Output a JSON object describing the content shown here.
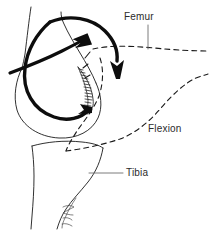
{
  "figure": {
    "background_color": "#ffffff",
    "ink_color": "#1a1a1a",
    "label_color": "#2b2b2b",
    "width": 209,
    "height": 241
  },
  "labels": {
    "femur": "Femur",
    "flexion": "Flexion",
    "tibia": "Tibia"
  },
  "leaders": {
    "femur": {
      "type": "vertical-leader-line",
      "from": [
        148,
        24
      ],
      "to": [
        148,
        49
      ]
    },
    "tibia": {
      "type": "horizontal-leader-line",
      "from": [
        89,
        173
      ],
      "to": [
        123,
        173
      ]
    }
  },
  "icons": {
    "roll_arrow": "curved-arrow-icon",
    "glide_arrow": "straight-arrow-icon",
    "loop_arrow": "loop-arrow-icon",
    "signature": "artist-signature-mark"
  },
  "strokes": {
    "femur_shaft": "M 30 8 L 25 62",
    "condyle_outline": "M 25 62 C 16 76 13 96 18 112 C 24 129 42 140 62 140 C 80 140 94 130 99 116 C 103 104 101 92 96 82",
    "condyle_inner": "M 96 82 C 92 72 85 62 78 52 C 73 45 68 38 64 30 C 62 25 61 20 61 16",
    "tibia_outline": "M 31 143 C 32 150 33 160 33 172 C 33 186 32 200 31 212 L 31 226",
    "tibia_plateau": "M 31 143 C 44 139 62 138 80 140 C 90 141 97 143 100 146",
    "tibia_lateral": "M 100 146 C 99 158 94 170 86 180 C 78 190 70 198 64 206 C 60 212 57 218 55 225",
    "loop_thick": "M 48 22 C 36 38 26 58 26 78 C 26 100 42 116 62 119 C 76 121 88 116 95 108",
    "arc_thick": "M 48 22 C 66 16 86 20 100 32 C 112 42 118 56 118 68",
    "glide_shaft": "M 12 72 C 28 66 48 58 64 50 C 74 45 82 40 88 36"
  },
  "hatch_region": {
    "name": "cartilage-contact-hatching",
    "description": "crescent of short cross-hatch strokes along posterior condyle",
    "stroke_count": 16
  },
  "dashed_outline": {
    "name": "flexed-femur-position",
    "style": "dashed",
    "paths": [
      "M 92 48 C 108 44 130 45 152 47 C 172 49 192 50 207 50",
      "M 100 57 C 104 68 104 82 100 94 C 95 108 85 120 78 130 C 72 139 68 146 66 152",
      "M 120 140 C 134 135 148 124 160 110 C 172 96 184 84 196 78 C 201 75 205 74 208 73",
      "M 66 152 C 80 150 100 146 120 140",
      "M 84 56 L 90 50",
      "M 82 66 L 88 62",
      "M 84 76 L 90 73"
    ]
  }
}
